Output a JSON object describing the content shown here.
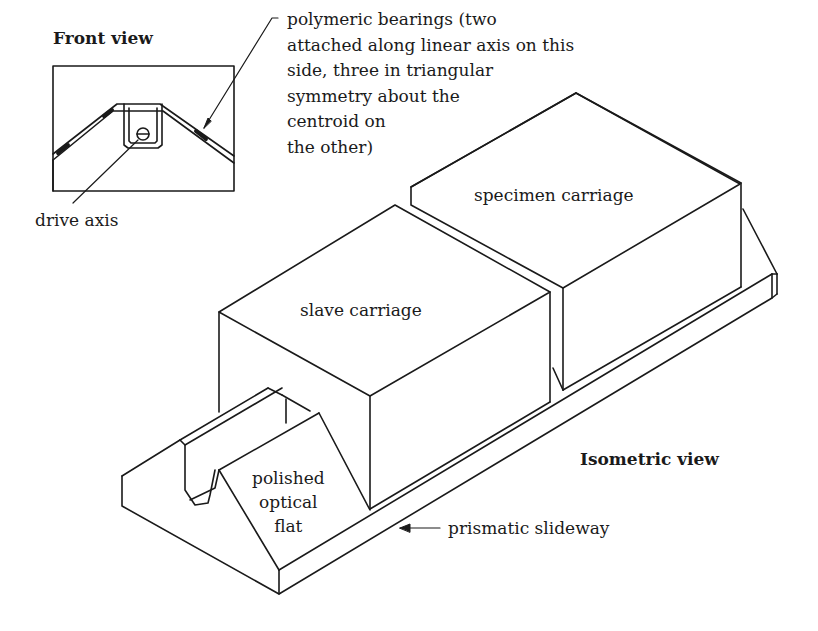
{
  "figure": {
    "front_view": {
      "title": "Front view",
      "labels": {
        "bearings": "polymeric bearings (two\nattached along linear axis on this\nside, three in triangular\nsymmetry about the\ncentroid on\nthe other)",
        "drive_axis": "drive axis"
      }
    },
    "isometric_view": {
      "title": "Isometric view",
      "labels": {
        "specimen_carriage": "specimen carriage",
        "slave_carriage": "slave carriage",
        "polished_optical_flat": "polished\noptical\nflat",
        "prismatic_slideway": "prismatic slideway"
      }
    },
    "colors": {
      "line": "#1a1a1a",
      "background": "#ffffff"
    }
  }
}
